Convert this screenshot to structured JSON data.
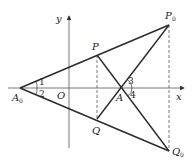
{
  "diagram": {
    "type": "geometry-coordinate-figure",
    "axes": {
      "x_label": "x",
      "y_label": "y",
      "origin_label": "O"
    },
    "points": [
      {
        "id": "A0",
        "label": "A",
        "subscript": "0",
        "x": 20,
        "y": 88
      },
      {
        "id": "O",
        "label": "O",
        "x": 69,
        "y": 88
      },
      {
        "id": "P",
        "label": "P",
        "x": 97,
        "y": 55
      },
      {
        "id": "Q",
        "label": "Q",
        "x": 97,
        "y": 119
      },
      {
        "id": "A",
        "label": "A",
        "x": 122,
        "y": 88
      },
      {
        "id": "P0",
        "label": "P",
        "subscript": "0",
        "x": 169,
        "y": 25
      },
      {
        "id": "Q0",
        "label": "Q",
        "subscript": "0",
        "x": 169,
        "y": 151
      }
    ],
    "segments_solid": [
      "A0-P0",
      "A0-Q0",
      "P-Q0",
      "Q-P0"
    ],
    "segments_dashed": [
      "P-Q",
      "P0-Q0"
    ],
    "angle_labels": [
      "1",
      "2",
      "3",
      "4"
    ],
    "colors": {
      "line": "#2a2a2a",
      "axis": "#555555",
      "background": "#ffffff"
    }
  }
}
